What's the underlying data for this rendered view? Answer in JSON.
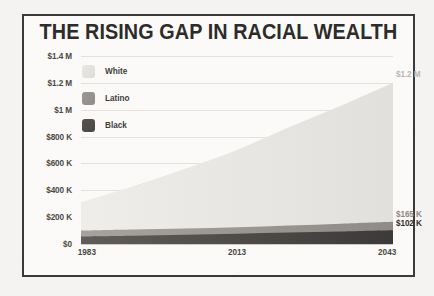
{
  "title": "THE RISING GAP IN RACIAL WEALTH",
  "legend": {
    "items": [
      {
        "label": "White",
        "color": "#e8e7e4"
      },
      {
        "label": "Latino",
        "color": "#9b9894"
      },
      {
        "label": "Black",
        "color": "#55524f"
      }
    ]
  },
  "callouts": {
    "white": "$1.2 M",
    "latino": "$165 K",
    "black": "$102 K"
  },
  "chart_data": {
    "type": "area",
    "title": "THE RISING GAP IN RACIAL WEALTH",
    "xlabel": "",
    "ylabel": "",
    "xlim": [
      1983,
      2043
    ],
    "ylim": [
      0,
      1400000
    ],
    "grid": true,
    "legend_position": "top-left-inside",
    "x_tick_labels": [
      "1983",
      "2013",
      "2043"
    ],
    "x_ticks": [
      1983,
      2013,
      2043
    ],
    "y_tick_labels": [
      "$1.4 M",
      "$1.2 M",
      "$1 M",
      "$800 K",
      "$600 K",
      "$400 K",
      "$200 K",
      "$0"
    ],
    "y_ticks": [
      1400000,
      1200000,
      1000000,
      800000,
      600000,
      400000,
      200000,
      0
    ],
    "x": [
      1983,
      1993,
      2003,
      2013,
      2023,
      2033,
      2043
    ],
    "series": [
      {
        "name": "White",
        "color": "#e8e7e4",
        "values": [
          310000,
          430000,
          560000,
          700000,
          870000,
          1030000,
          1200000
        ],
        "end_label": "$1.2 M"
      },
      {
        "name": "Latino",
        "color": "#9b9894",
        "values": [
          100000,
          108000,
          116000,
          125000,
          138000,
          151000,
          165000
        ],
        "end_label": "$165 K"
      },
      {
        "name": "Black",
        "color": "#55524f",
        "values": [
          55000,
          61000,
          68000,
          76000,
          85000,
          93000,
          102000
        ],
        "end_label": "$102 K"
      }
    ],
    "annotations": [
      {
        "text": "$1.2 M",
        "series": "White",
        "x": 2043,
        "y": 1200000
      },
      {
        "text": "$165 K",
        "series": "Latino",
        "x": 2043,
        "y": 165000
      },
      {
        "text": "$102 K",
        "series": "Black",
        "x": 2043,
        "y": 102000
      }
    ]
  }
}
